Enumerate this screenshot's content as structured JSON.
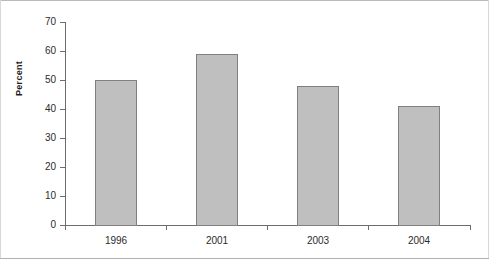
{
  "chart_data": {
    "type": "bar",
    "title": "",
    "subtitle": "",
    "xlabel": "",
    "ylabel": "Percent",
    "categories": [
      "1996",
      "2001",
      "2003",
      "2004"
    ],
    "values": [
      50,
      59,
      48,
      41
    ],
    "series": [
      {
        "name": "Percent",
        "values": [
          50,
          59,
          48,
          41
        ]
      }
    ],
    "ylim": [
      0,
      70
    ],
    "ytick_labels": [
      "0",
      "10",
      "20",
      "30",
      "40",
      "50",
      "60",
      "70"
    ],
    "ytick_values": [
      0,
      10,
      20,
      30,
      40,
      50,
      60,
      70
    ],
    "grid": false,
    "legend": false,
    "legend_position": "none",
    "annotations": [],
    "colors": {
      "bar_fill": "#bfbfbf",
      "bar_border": "#808080",
      "axis": "#6d6d6d",
      "text": "#2b2b2b",
      "background": "#ffffff",
      "frame_rule": "#b0b0b0"
    }
  }
}
